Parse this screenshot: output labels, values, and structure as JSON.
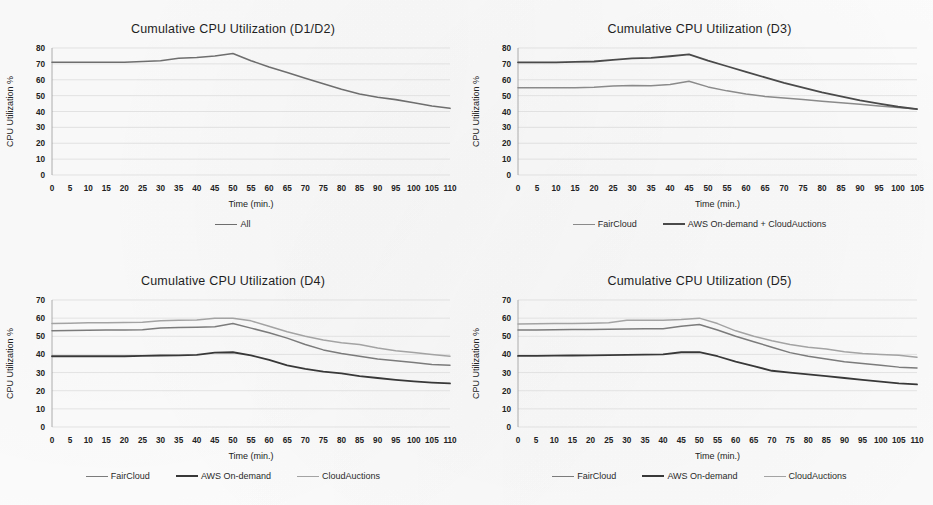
{
  "page": {
    "background": "#ffffff",
    "layout": "2x2 grid of line charts"
  },
  "palette": {
    "fairCloud": "#6e6e6e",
    "awsOnDemand": "#3a3a3a",
    "cloudAuctions": "#9c9c9c",
    "all": "#6e6e6e",
    "awsPlusCloudAuctions": "#4a4a4a",
    "gridline": "#d9d9d9",
    "axis": "#9a9a9a",
    "text": "#1f1f1f"
  },
  "charts": [
    {
      "id": "d1d2",
      "panel_name": "chart-panel-d1-d2",
      "chart_data": {
        "type": "line",
        "title": "Cumulative CPU Utilization (D1/D2)",
        "xlabel": "Time (min.)",
        "ylabel": "CPU Utilization %",
        "xlim": [
          0,
          110
        ],
        "ylim": [
          0,
          80
        ],
        "ytick_step": 10,
        "xtick_step": 5,
        "grid": true,
        "legend_position": "bottom",
        "categories": [
          0,
          5,
          10,
          15,
          20,
          25,
          30,
          35,
          40,
          45,
          50,
          55,
          60,
          65,
          70,
          75,
          80,
          85,
          90,
          95,
          100,
          105,
          110
        ],
        "yticks": [
          0,
          10,
          20,
          30,
          40,
          50,
          60,
          70,
          80
        ],
        "xticks": [
          0,
          5,
          10,
          15,
          20,
          25,
          30,
          35,
          40,
          45,
          50,
          55,
          60,
          65,
          70,
          75,
          80,
          85,
          90,
          95,
          100,
          105,
          110
        ],
        "series": [
          {
            "name": "All",
            "color": "#6e6e6e",
            "width": 1.6,
            "values": [
              71,
              71,
              71,
              71,
              71,
              71.5,
              72,
              73.5,
              74,
              75,
              76.5,
              72,
              68,
              64.5,
              61,
              57.5,
              54,
              51,
              49,
              47.5,
              45.5,
              43.5,
              42
            ]
          }
        ]
      }
    },
    {
      "id": "d3",
      "panel_name": "chart-panel-d3",
      "chart_data": {
        "type": "line",
        "title": "Cumulative CPU Utilization (D3)",
        "xlabel": "Time (min.)",
        "ylabel": "CPU Utilization %",
        "xlim": [
          0,
          105
        ],
        "ylim": [
          0,
          80
        ],
        "ytick_step": 10,
        "xtick_step": 5,
        "grid": true,
        "legend_position": "bottom",
        "categories": [
          0,
          5,
          10,
          15,
          20,
          25,
          30,
          35,
          40,
          45,
          50,
          55,
          60,
          65,
          70,
          75,
          80,
          85,
          90,
          95,
          100,
          105
        ],
        "yticks": [
          0,
          10,
          20,
          30,
          40,
          50,
          60,
          70,
          80
        ],
        "xticks": [
          0,
          5,
          10,
          15,
          20,
          25,
          30,
          35,
          40,
          45,
          50,
          55,
          60,
          65,
          70,
          75,
          80,
          85,
          90,
          95,
          100,
          105
        ],
        "series": [
          {
            "name": "FairCloud",
            "color": "#8a8a8a",
            "width": 1.5,
            "values": [
              55,
              55,
              55,
              55,
              55.2,
              56,
              56.3,
              56.2,
              57,
              59,
              55.5,
              53,
              51,
              49.5,
              48.5,
              47.5,
              46.5,
              45.5,
              44.5,
              43.5,
              42.5,
              41.5
            ]
          },
          {
            "name": "AWS On-demand + CloudAuctions",
            "color": "#4a4a4a",
            "width": 1.8,
            "values": [
              71,
              71,
              71,
              71.2,
              71.5,
              72.5,
              73.5,
              73.8,
              74.8,
              76,
              72,
              68.5,
              65,
              61.5,
              58,
              55,
              52,
              49.5,
              47,
              45,
              43,
              41.5
            ]
          }
        ]
      }
    },
    {
      "id": "d4",
      "panel_name": "chart-panel-d4",
      "chart_data": {
        "type": "line",
        "title": "Cumulative CPU Utilization (D4)",
        "xlabel": "Time (min.)",
        "ylabel": "CPU Utilization %",
        "xlim": [
          0,
          110
        ],
        "ylim": [
          0,
          70
        ],
        "ytick_step": 10,
        "xtick_step": 5,
        "grid": true,
        "legend_position": "bottom",
        "categories": [
          0,
          5,
          10,
          15,
          20,
          25,
          30,
          35,
          40,
          45,
          50,
          55,
          60,
          65,
          70,
          75,
          80,
          85,
          90,
          95,
          100,
          105,
          110
        ],
        "yticks": [
          0,
          10,
          20,
          30,
          40,
          50,
          60,
          70
        ],
        "xticks": [
          0,
          5,
          10,
          15,
          20,
          25,
          30,
          35,
          40,
          45,
          50,
          55,
          60,
          65,
          70,
          75,
          80,
          85,
          90,
          95,
          100,
          105,
          110
        ],
        "series": [
          {
            "name": "FairCloud",
            "color": "#7b7b7b",
            "width": 1.5,
            "values": [
              53,
              53.2,
              53.3,
              53.4,
              53.5,
              53.6,
              54.5,
              54.8,
              55,
              55.2,
              57,
              54.5,
              52,
              49,
              45.5,
              42.5,
              40.5,
              39,
              37.5,
              36.5,
              35.5,
              34.5,
              34
            ]
          },
          {
            "name": "AWS On-demand",
            "color": "#383838",
            "width": 1.8,
            "values": [
              39,
              39,
              39,
              39,
              39,
              39.2,
              39.4,
              39.5,
              39.7,
              41,
              41.2,
              39.5,
              37,
              34,
              32,
              30.5,
              29.5,
              28,
              27,
              26,
              25.2,
              24.5,
              24
            ]
          },
          {
            "name": "CloudAuctions",
            "color": "#a3a3a3",
            "width": 1.5,
            "values": [
              57,
              57.2,
              57.4,
              57.5,
              57.6,
              57.8,
              58.5,
              58.8,
              59,
              60,
              60,
              58.5,
              55.5,
              52.5,
              50,
              48,
              46.5,
              45.5,
              43.5,
              42,
              41,
              40,
              39
            ]
          }
        ]
      }
    },
    {
      "id": "d5",
      "panel_name": "chart-panel-d5",
      "chart_data": {
        "type": "line",
        "title": "Cumulative CPU Utilization (D5)",
        "xlabel": "Time (min.)",
        "ylabel": "CPU Utilization %",
        "xlim": [
          0,
          110
        ],
        "ylim": [
          0,
          70
        ],
        "ytick_step": 10,
        "xtick_step": 5,
        "grid": true,
        "legend_position": "bottom",
        "categories": [
          0,
          5,
          10,
          15,
          20,
          25,
          30,
          35,
          40,
          45,
          50,
          55,
          60,
          65,
          70,
          75,
          80,
          85,
          90,
          95,
          100,
          105,
          110
        ],
        "yticks": [
          0,
          10,
          20,
          30,
          40,
          50,
          60,
          70
        ],
        "xticks": [
          0,
          5,
          10,
          15,
          20,
          25,
          30,
          35,
          40,
          45,
          50,
          55,
          60,
          65,
          70,
          75,
          80,
          85,
          90,
          95,
          100,
          105,
          110
        ],
        "series": [
          {
            "name": "FairCloud",
            "color": "#7b7b7b",
            "width": 1.5,
            "values": [
              53.5,
              53.5,
              53.6,
              53.7,
              53.8,
              53.9,
              54,
              54.1,
              54.2,
              55.5,
              56.5,
              53.5,
              50,
              47,
              44,
              41,
              39,
              37.5,
              36,
              35,
              34,
              33,
              32.5
            ]
          },
          {
            "name": "AWS On-demand",
            "color": "#383838",
            "width": 1.8,
            "values": [
              39.2,
              39.2,
              39.3,
              39.4,
              39.5,
              39.6,
              39.8,
              39.9,
              40,
              41.2,
              41.3,
              39,
              36,
              33.5,
              31,
              30,
              29,
              28,
              27,
              26,
              25,
              24,
              23.5
            ]
          },
          {
            "name": "CloudAuctions",
            "color": "#a3a3a3",
            "width": 1.5,
            "values": [
              56.8,
              56.9,
              57,
              57.1,
              57.2,
              57.5,
              58.8,
              58.8,
              58.8,
              59.2,
              60,
              57,
              53,
              50,
              47.5,
              45.5,
              44,
              43,
              41.5,
              40.5,
              40,
              39.5,
              38.5
            ]
          }
        ]
      }
    }
  ]
}
